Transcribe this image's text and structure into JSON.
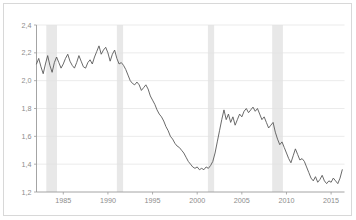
{
  "chart_data": {
    "type": "line",
    "title": "",
    "subtitle": "",
    "xlabel": "",
    "ylabel": "",
    "xlim": [
      1982.0,
      2016.5
    ],
    "ylim": [
      1.2,
      2.4
    ],
    "grid": true,
    "legend": "none",
    "decimal_separator": ",",
    "y_ticks": [
      {
        "value": 2.4,
        "label": "2,4"
      },
      {
        "value": 2.2,
        "label": "2,2"
      },
      {
        "value": 2.0,
        "label": "2,0"
      },
      {
        "value": 1.8,
        "label": "1,8"
      },
      {
        "value": 1.6,
        "label": "1,6"
      },
      {
        "value": 1.4,
        "label": "1,4"
      },
      {
        "value": 1.2,
        "label": "1,2"
      }
    ],
    "x_ticks": [
      {
        "value": 1985,
        "label": "1985"
      },
      {
        "value": 1990,
        "label": "1990"
      },
      {
        "value": 1995,
        "label": "1995"
      },
      {
        "value": 2000,
        "label": "2000"
      },
      {
        "value": 2005,
        "label": "2005"
      },
      {
        "value": 2010,
        "label": "2010"
      },
      {
        "value": 2015,
        "label": "2015"
      }
    ],
    "shaded_bands_label": "recession-bands",
    "shaded_band_color": "#e8e8e8",
    "shaded_bands": [
      {
        "start": 1983.1,
        "end": 1984.3
      },
      {
        "start": 1991.0,
        "end": 1991.7
      },
      {
        "start": 2001.2,
        "end": 2001.9
      },
      {
        "start": 2008.4,
        "end": 2009.6
      }
    ],
    "series": [
      {
        "name": "series-1",
        "color": "#595959",
        "x": [
          1982.0,
          1982.25,
          1982.5,
          1982.75,
          1983.0,
          1983.25,
          1983.5,
          1983.75,
          1984.0,
          1984.25,
          1984.5,
          1984.75,
          1985.0,
          1985.25,
          1985.5,
          1985.75,
          1986.0,
          1986.25,
          1986.5,
          1986.75,
          1987.0,
          1987.25,
          1987.5,
          1987.75,
          1988.0,
          1988.25,
          1988.5,
          1988.75,
          1989.0,
          1989.25,
          1989.5,
          1989.75,
          1990.0,
          1990.25,
          1990.5,
          1990.75,
          1991.0,
          1991.25,
          1991.5,
          1991.75,
          1992.0,
          1992.25,
          1992.5,
          1992.75,
          1993.0,
          1993.25,
          1993.5,
          1993.75,
          1994.0,
          1994.25,
          1994.5,
          1994.75,
          1995.0,
          1995.25,
          1995.5,
          1995.75,
          1996.0,
          1996.25,
          1996.5,
          1996.75,
          1997.0,
          1997.25,
          1997.5,
          1997.75,
          1998.0,
          1998.25,
          1998.5,
          1998.75,
          1999.0,
          1999.25,
          1999.5,
          1999.75,
          2000.0,
          2000.25,
          2000.5,
          2000.75,
          2001.0,
          2001.25,
          2001.5,
          2001.75,
          2002.0,
          2002.25,
          2002.5,
          2002.75,
          2003.0,
          2003.25,
          2003.5,
          2003.75,
          2004.0,
          2004.25,
          2004.5,
          2004.75,
          2005.0,
          2005.25,
          2005.5,
          2005.75,
          2006.0,
          2006.25,
          2006.5,
          2006.75,
          2007.0,
          2007.25,
          2007.5,
          2007.75,
          2008.0,
          2008.25,
          2008.5,
          2008.75,
          2009.0,
          2009.25,
          2009.5,
          2009.75,
          2010.0,
          2010.25,
          2010.5,
          2010.75,
          2011.0,
          2011.25,
          2011.5,
          2011.75,
          2012.0,
          2012.25,
          2012.5,
          2012.75,
          2013.0,
          2013.25,
          2013.5,
          2013.75,
          2014.0,
          2014.25,
          2014.5,
          2014.75,
          2015.0,
          2015.25,
          2015.5,
          2015.75,
          2016.0,
          2016.25
        ],
        "y": [
          2.12,
          2.16,
          2.1,
          2.05,
          2.12,
          2.18,
          2.11,
          2.06,
          2.13,
          2.17,
          2.13,
          2.09,
          2.12,
          2.16,
          2.19,
          2.14,
          2.11,
          2.09,
          2.13,
          2.18,
          2.14,
          2.1,
          2.09,
          2.13,
          2.15,
          2.12,
          2.17,
          2.21,
          2.25,
          2.19,
          2.22,
          2.24,
          2.2,
          2.14,
          2.19,
          2.22,
          2.16,
          2.12,
          2.13,
          2.11,
          2.08,
          2.04,
          2.0,
          1.98,
          1.97,
          1.99,
          1.97,
          1.93,
          1.95,
          1.97,
          1.94,
          1.89,
          1.86,
          1.83,
          1.79,
          1.76,
          1.74,
          1.71,
          1.67,
          1.64,
          1.6,
          1.58,
          1.55,
          1.53,
          1.52,
          1.5,
          1.48,
          1.45,
          1.42,
          1.4,
          1.38,
          1.37,
          1.38,
          1.36,
          1.37,
          1.36,
          1.38,
          1.37,
          1.39,
          1.42,
          1.48,
          1.56,
          1.64,
          1.72,
          1.79,
          1.72,
          1.76,
          1.7,
          1.74,
          1.68,
          1.72,
          1.76,
          1.74,
          1.78,
          1.8,
          1.77,
          1.79,
          1.81,
          1.78,
          1.8,
          1.76,
          1.72,
          1.74,
          1.7,
          1.66,
          1.68,
          1.7,
          1.63,
          1.58,
          1.54,
          1.56,
          1.52,
          1.48,
          1.44,
          1.41,
          1.46,
          1.51,
          1.47,
          1.43,
          1.44,
          1.42,
          1.38,
          1.34,
          1.3,
          1.28,
          1.31,
          1.27,
          1.29,
          1.32,
          1.28,
          1.26,
          1.28,
          1.27,
          1.3,
          1.28,
          1.26,
          1.3,
          1.36
        ]
      }
    ]
  }
}
